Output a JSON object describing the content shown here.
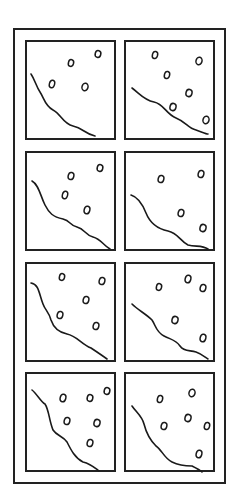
{
  "diagram": {
    "title": "",
    "colors": {
      "stroke": "#1a1a1a",
      "frame": "#222222",
      "background": "#ffffff"
    },
    "panels": [
      {
        "id": "panel-1",
        "row": 1,
        "col": 1,
        "curve": "M4,32 C8,38 9,44 13,50 C17,56 18,64 26,68 C34,72 36,82 46,84 C56,86 58,92 68,94",
        "dots": [
          [
            44,
            21,
            2.6,
            3.4
          ],
          [
            71,
            12,
            2.8,
            3.4
          ],
          [
            25,
            42,
            2.6,
            3.8
          ],
          [
            58,
            45,
            3,
            3.8
          ]
        ]
      },
      {
        "id": "panel-2",
        "row": 1,
        "col": 2,
        "curve": "M6,46 C14,52 18,58 28,60 C38,62 40,72 50,76 C60,80 62,86 70,88 C76,90 80,92 82,92",
        "dots": [
          [
            29,
            13,
            2.6,
            3.6
          ],
          [
            73,
            19,
            3,
            3.8
          ],
          [
            41,
            33,
            2.6,
            3.6
          ],
          [
            63,
            51,
            3,
            3.6
          ],
          [
            47,
            65,
            3,
            3.6
          ],
          [
            80,
            78,
            3,
            3.8
          ]
        ]
      },
      {
        "id": "panel-3",
        "row": 2,
        "col": 1,
        "curve": "M5,28 C12,32 13,42 18,52 C22,60 26,64 36,66 C44,68 42,72 50,74 C58,76 58,82 66,84 C74,86 76,92 83,96",
        "dots": [
          [
            44,
            23,
            2.8,
            3.6
          ],
          [
            73,
            15,
            2.8,
            3.4
          ],
          [
            38,
            42,
            2.6,
            3.8
          ],
          [
            60,
            57,
            2.8,
            3.8
          ]
        ]
      },
      {
        "id": "panel-4",
        "row": 2,
        "col": 2,
        "curve": "M5,42 C12,44 16,50 20,60 C24,70 32,76 42,78 C52,80 54,88 62,92 C70,94 76,92 82,96",
        "dots": [
          [
            35,
            26,
            2.8,
            3.6
          ],
          [
            75,
            21,
            2.8,
            3.6
          ],
          [
            55,
            60,
            2.8,
            3.6
          ],
          [
            77,
            75,
            3,
            3.6
          ]
        ]
      },
      {
        "id": "panel-4b",
        "row": 3,
        "col": 1,
        "curve": "M4,19 C12,20 12,30 16,40 C18,46 22,48 24,56 C26,62 30,68 40,70 C50,72 54,80 64,84 C70,88 76,92 80,95",
        "dots": [
          [
            35,
            13,
            2.6,
            3.4
          ],
          [
            75,
            17,
            2.8,
            3.6
          ],
          [
            59,
            36,
            2.8,
            3.6
          ],
          [
            33,
            51,
            2.8,
            3.6
          ],
          [
            69,
            62,
            2.8,
            3.6
          ]
        ]
      },
      {
        "id": "panel-6",
        "row": 3,
        "col": 2,
        "curve": "M6,40 C12,46 20,50 26,56 C30,62 30,68 38,72 C46,76 50,76 54,82 C58,88 64,86 70,88 C76,90 80,94 82,95",
        "dots": [
          [
            33,
            23,
            2.6,
            3.4
          ],
          [
            62,
            15,
            2.8,
            3.8
          ],
          [
            77,
            24,
            2.8,
            3.6
          ],
          [
            49,
            56,
            3,
            3.6
          ],
          [
            77,
            74,
            2.8,
            3.8
          ]
        ]
      },
      {
        "id": "panel-7",
        "row": 4,
        "col": 1,
        "curve": "M5,16 C10,20 14,28 18,30 C22,36 22,46 26,56 C30,62 36,62 40,68 C44,76 48,84 56,88 C64,90 68,94 72,97",
        "dots": [
          [
            36,
            24,
            2.8,
            3.8
          ],
          [
            63,
            24,
            2.8,
            3.4
          ],
          [
            80,
            17,
            2.8,
            3.4
          ],
          [
            40,
            47,
            2.8,
            3.6
          ],
          [
            70,
            49,
            3,
            3.6
          ],
          [
            63,
            69,
            2.8,
            3.6
          ]
        ]
      },
      {
        "id": "panel-8",
        "row": 4,
        "col": 2,
        "curve": "M6,32 C10,38 16,42 18,50 C20,58 24,66 30,72 C36,76 38,84 46,88 C54,92 60,92 66,92 C70,94 74,96 76,98",
        "dots": [
          [
            34,
            25,
            2.6,
            3.6
          ],
          [
            66,
            19,
            3,
            3.8
          ],
          [
            62,
            44,
            3,
            3.6
          ],
          [
            38,
            52,
            2.8,
            3.6
          ],
          [
            81,
            52,
            2.6,
            3.6
          ],
          [
            73,
            80,
            2.8,
            3.8
          ]
        ]
      }
    ]
  }
}
